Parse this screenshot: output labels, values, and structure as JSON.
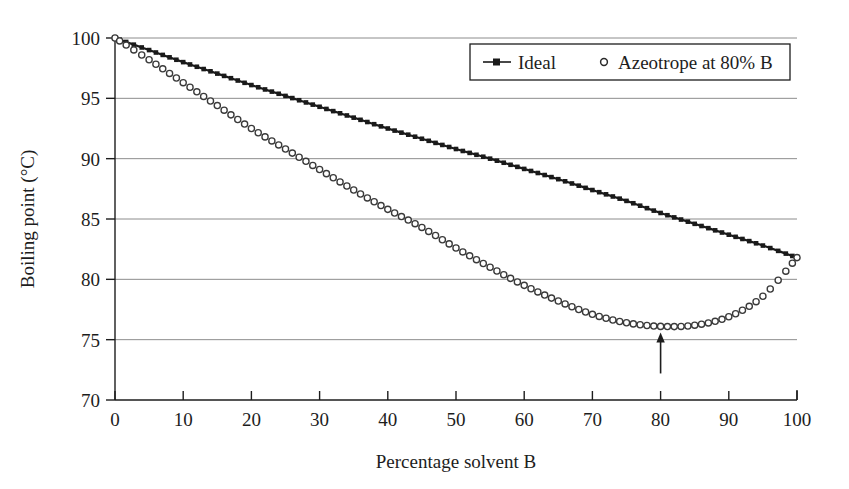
{
  "chart_data": {
    "type": "line",
    "title": "",
    "xlabel": "Percentage solvent B",
    "ylabel": "Boiling point (°C)",
    "xlim": [
      0,
      100
    ],
    "ylim": [
      70,
      100
    ],
    "xticks": [
      "0",
      "10",
      "20",
      "30",
      "40",
      "50",
      "60",
      "70",
      "80",
      "90",
      "100"
    ],
    "yticks": [
      "70",
      "75",
      "80",
      "85",
      "90",
      "95",
      "100"
    ],
    "grid": "horizontal",
    "legend_position": "top-right",
    "series": [
      {
        "name": "Ideal",
        "marker": "filled-square",
        "x": [
          0,
          5,
          10,
          15,
          20,
          25,
          30,
          35,
          40,
          45,
          50,
          55,
          60,
          65,
          70,
          75,
          80,
          85,
          90,
          95,
          100
        ],
        "values": [
          100.0,
          99.0,
          98.0,
          97.05,
          96.1,
          95.2,
          94.3,
          93.4,
          92.5,
          91.65,
          90.8,
          90.0,
          89.15,
          88.3,
          87.4,
          86.5,
          85.5,
          84.6,
          83.7,
          82.8,
          81.8
        ]
      },
      {
        "name": "Azeotrope at 80% B",
        "marker": "open-circle",
        "x": [
          0,
          5,
          10,
          15,
          20,
          25,
          30,
          35,
          40,
          45,
          50,
          55,
          60,
          65,
          70,
          75,
          80,
          85,
          90,
          95,
          100
        ],
        "values": [
          100.0,
          98.2,
          96.3,
          94.4,
          92.5,
          90.8,
          89.1,
          87.4,
          85.8,
          84.3,
          82.6,
          81.0,
          79.5,
          78.2,
          77.1,
          76.4,
          76.1,
          76.2,
          76.9,
          78.6,
          81.8
        ]
      }
    ],
    "annotations": [
      {
        "type": "arrow",
        "name": "azeotrope-arrow",
        "x": 80,
        "y_from": 72.2,
        "y_to": 75.6,
        "direction": "up"
      }
    ]
  },
  "legend": {
    "items": [
      {
        "label": "Ideal",
        "marker": "line-with-square"
      },
      {
        "label": "Azeotrope at 80% B",
        "marker": "open-circle"
      }
    ]
  },
  "colors": {
    "ideal_series": "#1a1a1a",
    "azeotrope_series": "#3a3a3a",
    "gridline": "#808080",
    "axis": "#1d1d1d",
    "background": "#ffffff"
  }
}
